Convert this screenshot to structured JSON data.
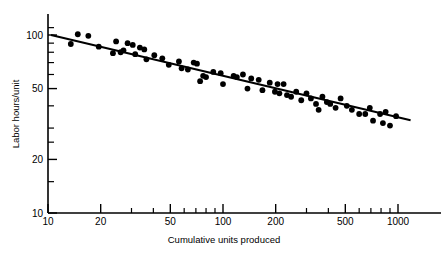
{
  "chart_data": {
    "type": "scatter",
    "title": "",
    "xlabel": "Cumulative units produced",
    "ylabel": "Labor hours/unit",
    "xscale": "log",
    "yscale": "log",
    "xlim": [
      10,
      1250
    ],
    "ylim": [
      10,
      118
    ],
    "grid": false,
    "legend": null,
    "xticks": [
      10,
      20,
      50,
      100,
      200,
      500,
      1000
    ],
    "xtick_labels": [
      "10",
      "20",
      "50",
      "100",
      "200",
      "500",
      "1000"
    ],
    "yticks": [
      10,
      20,
      50,
      100
    ],
    "ytick_labels": [
      "10",
      "20",
      "50",
      "100"
    ],
    "x_minor_ticks": [
      30,
      40,
      60,
      70,
      80,
      90,
      300,
      400,
      600,
      700,
      800,
      900
    ],
    "y_minor_ticks": [
      15,
      25,
      30,
      40,
      60,
      70,
      80,
      90,
      110
    ],
    "series": [
      {
        "name": "observations",
        "marker": "circle",
        "color": "#000000",
        "points": [
          [
            13.5,
            89
          ],
          [
            14.8,
            101
          ],
          [
            17.0,
            99
          ],
          [
            19.5,
            86
          ],
          [
            23.5,
            79
          ],
          [
            24.5,
            92
          ],
          [
            26.0,
            80
          ],
          [
            27.0,
            82
          ],
          [
            28.5,
            90
          ],
          [
            30.5,
            88
          ],
          [
            31.5,
            78
          ],
          [
            33.5,
            85
          ],
          [
            35.5,
            83
          ],
          [
            36.5,
            73
          ],
          [
            40.5,
            77
          ],
          [
            45.0,
            74
          ],
          [
            49.0,
            68
          ],
          [
            56.0,
            71
          ],
          [
            58.0,
            65
          ],
          [
            63.0,
            64
          ],
          [
            68.0,
            70
          ],
          [
            71.0,
            69
          ],
          [
            74.0,
            55
          ],
          [
            77.0,
            59
          ],
          [
            80.0,
            58
          ],
          [
            88.0,
            62
          ],
          [
            97.0,
            61
          ],
          [
            100.0,
            53
          ],
          [
            115.0,
            59
          ],
          [
            120.0,
            58
          ],
          [
            130.0,
            60
          ],
          [
            138.0,
            50
          ],
          [
            145.0,
            57
          ],
          [
            160.0,
            56
          ],
          [
            168.0,
            49
          ],
          [
            185.0,
            54
          ],
          [
            198.0,
            48
          ],
          [
            205.0,
            53
          ],
          [
            210.0,
            47
          ],
          [
            222.0,
            53
          ],
          [
            232.0,
            46
          ],
          [
            245.0,
            45
          ],
          [
            262.0,
            48
          ],
          [
            280.0,
            43
          ],
          [
            300.0,
            47
          ],
          [
            318.0,
            44
          ],
          [
            340.0,
            41
          ],
          [
            352.0,
            38
          ],
          [
            370.0,
            45
          ],
          [
            392.0,
            42
          ],
          [
            410.0,
            41
          ],
          [
            440.0,
            39
          ],
          [
            470.0,
            44
          ],
          [
            510.0,
            40
          ],
          [
            545.0,
            38
          ],
          [
            600.0,
            36
          ],
          [
            650.0,
            36
          ],
          [
            690.0,
            39
          ],
          [
            720.0,
            33
          ],
          [
            790.0,
            36
          ],
          [
            820.0,
            32
          ],
          [
            850.0,
            37
          ],
          [
            900.0,
            31
          ],
          [
            975.0,
            35
          ]
        ]
      }
    ],
    "trend_line": {
      "name": "fitted learning curve",
      "color": "#000000",
      "x_start": 10.4,
      "y_start": 100,
      "x_end": 1180,
      "y_end": 33.2
    }
  },
  "axes": {
    "y_title": "Labor hours/unit",
    "x_title": "Cumulative units produced",
    "y_labels": [
      "100",
      "50",
      "20",
      "10"
    ],
    "x_labels": [
      "10",
      "20",
      "50",
      "100",
      "200",
      "500",
      "1000"
    ]
  }
}
